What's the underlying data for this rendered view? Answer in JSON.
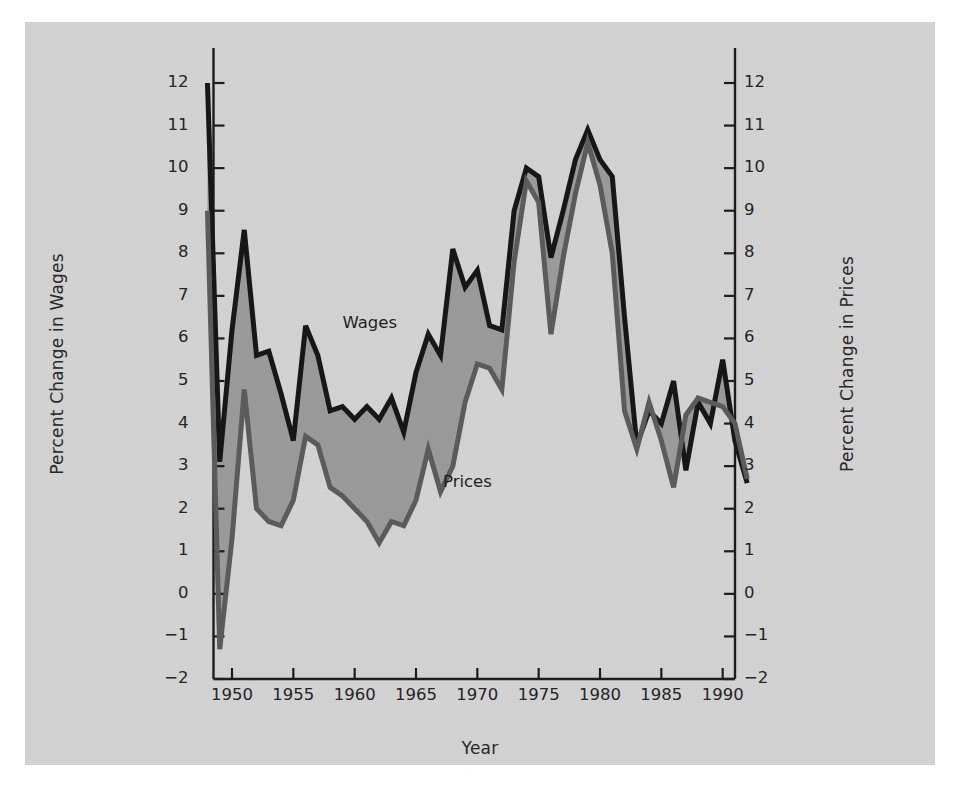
{
  "chart_data": {
    "type": "line",
    "title": "",
    "xlabel": "Year",
    "ylabel": "Percent Change in Wages",
    "ylabel_right": "Percent Change in Prices",
    "xlim": [
      1948,
      1992
    ],
    "ylim": [
      -2,
      12
    ],
    "ylim_right": [
      -2,
      12
    ],
    "grid": false,
    "legend_position": "inline-annotation",
    "x_ticks": [
      1950,
      1955,
      1960,
      1965,
      1970,
      1975,
      1980,
      1985,
      1990
    ],
    "y_ticks": [
      -2,
      -1,
      0,
      1,
      2,
      3,
      4,
      5,
      6,
      7,
      8,
      9,
      10,
      11,
      12
    ],
    "y_ticks_right": [
      -2,
      -1,
      0,
      1,
      2,
      3,
      4,
      5,
      6,
      7,
      8,
      9,
      10,
      11,
      12
    ],
    "fill_between": true,
    "fill_color": "#9a9a9a",
    "x": [
      1948,
      1949,
      1950,
      1951,
      1952,
      1953,
      1954,
      1955,
      1956,
      1957,
      1958,
      1959,
      1960,
      1961,
      1962,
      1963,
      1964,
      1965,
      1966,
      1967,
      1968,
      1969,
      1970,
      1971,
      1972,
      1973,
      1974,
      1975,
      1976,
      1977,
      1978,
      1979,
      1980,
      1981,
      1982,
      1983,
      1984,
      1985,
      1986,
      1987,
      1988,
      1989,
      1990,
      1991,
      1992
    ],
    "series": [
      {
        "name": "Wages",
        "color": "#141414",
        "linewidth": 5,
        "values": [
          12.0,
          3.1,
          6.2,
          8.55,
          5.6,
          5.7,
          4.7,
          3.6,
          6.3,
          5.6,
          4.3,
          4.4,
          4.1,
          4.4,
          4.1,
          4.6,
          3.8,
          5.2,
          6.1,
          5.6,
          8.1,
          7.2,
          7.6,
          6.3,
          6.2,
          9.0,
          10.0,
          9.8,
          7.9,
          9.0,
          10.2,
          10.9,
          10.2,
          9.8,
          6.5,
          3.5,
          4.3,
          4.0,
          5.0,
          2.9,
          4.5,
          4.0,
          5.5,
          3.6,
          2.6
        ]
      },
      {
        "name": "Prices",
        "color": "#5a5a5a",
        "linewidth": 5,
        "values": [
          9.0,
          -1.3,
          1.3,
          4.8,
          2.0,
          1.7,
          1.6,
          2.2,
          3.7,
          3.5,
          2.5,
          2.3,
          2.0,
          1.7,
          1.2,
          1.7,
          1.6,
          2.2,
          3.4,
          2.4,
          3.0,
          4.5,
          5.4,
          5.3,
          4.8,
          7.8,
          9.7,
          9.2,
          6.1,
          7.9,
          9.4,
          10.6,
          9.6,
          8.0,
          4.3,
          3.4,
          4.5,
          3.6,
          2.5,
          4.2,
          4.6,
          4.5,
          4.4,
          4.0,
          2.7
        ]
      }
    ],
    "annotations": [
      {
        "text": "Wages",
        "x": 1959.0,
        "y": 6.35
      },
      {
        "text": "Prices",
        "x": 1967.2,
        "y": 2.6
      }
    ]
  },
  "colors": {
    "panel_background": "#d3d3d3",
    "page_background": "#ffffff",
    "axis": "#1a1a1a",
    "wages_line": "#141414",
    "prices_line": "#5a5a5a",
    "fill": "#9a9a9a",
    "text": "#222222"
  }
}
